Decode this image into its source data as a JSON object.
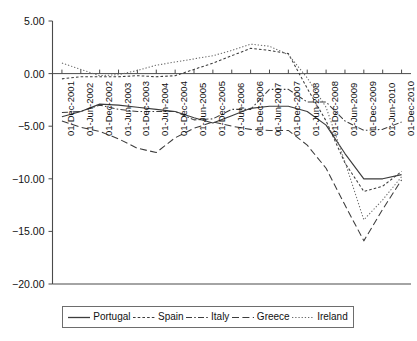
{
  "chart_data": {
    "type": "line",
    "title": "",
    "xlabel": "",
    "ylabel": "",
    "ylim": [
      -20.0,
      5.0
    ],
    "grid": false,
    "legend_position": "bottom",
    "y_ticks": [
      "5.00",
      "0.00",
      "-5.00",
      "-10.00",
      "-15.00",
      "-20.00"
    ],
    "y_tick_values": [
      5.0,
      0.0,
      -5.0,
      -10.0,
      -15.0,
      -20.0
    ],
    "categories": [
      "01-Dec-2001",
      "01-Jun-2002",
      "01-Dec-2002",
      "01-Jun-2003",
      "01-Dec-2003",
      "01-Jun-2004",
      "01-Dec-2004",
      "01-Jun-2005",
      "01-Dec-2005",
      "01-Jun-2006",
      "01-Dec-2006",
      "01-Jun-2007",
      "01-Dec-2007",
      "01-Jun-2008",
      "01-Dec-2008",
      "01-Jun-2009",
      "01-Dec-2009",
      "01-Jun-2010",
      "01-Dec-2010"
    ],
    "series": [
      {
        "name": "Portugal",
        "style": "solid",
        "color": "#3c3c3c",
        "values": [
          -4.1,
          -3.6,
          -2.9,
          -3.0,
          -3.2,
          -3.4,
          -3.6,
          -4.2,
          -4.7,
          -4.0,
          -3.3,
          -3.1,
          -3.1,
          -3.6,
          -4.9,
          -7.6,
          -10.0,
          -10.0,
          -9.6
        ]
      },
      {
        "name": "Spain",
        "style": "dotted",
        "color": "#3c3c3c",
        "values": [
          -0.5,
          -0.3,
          -0.3,
          -0.3,
          -0.2,
          -0.3,
          -0.2,
          0.4,
          1.0,
          1.7,
          2.4,
          2.2,
          1.9,
          -1.4,
          -4.5,
          -8.5,
          -11.2,
          -10.7,
          -9.3
        ]
      },
      {
        "name": "Italy",
        "style": "dashdot",
        "color": "#3c3c3c",
        "values": [
          -3.7,
          -3.6,
          -3.0,
          -3.4,
          -3.6,
          -3.6,
          -3.6,
          -4.4,
          -4.3,
          -3.4,
          -3.4,
          -1.5,
          -1.5,
          -2.7,
          -2.7,
          -4.5,
          -5.4,
          -5.3,
          -4.6
        ]
      },
      {
        "name": "Greece",
        "style": "dashed",
        "color": "#3c3c3c",
        "values": [
          -4.5,
          -5.1,
          -5.5,
          -6.2,
          -7.1,
          -7.5,
          -6.1,
          -5.2,
          -4.6,
          -5.0,
          -5.3,
          -5.4,
          -5.4,
          -6.8,
          -9.0,
          -12.5,
          -15.9,
          -12.9,
          -10.1
        ]
      },
      {
        "name": "Ireland",
        "style": "finedot",
        "color": "#6a6a6a",
        "values": [
          1.0,
          0.4,
          -0.2,
          -0.1,
          0.3,
          0.8,
          1.1,
          1.4,
          1.7,
          2.2,
          2.8,
          2.6,
          1.8,
          -0.4,
          -3.2,
          -8.4,
          -13.9,
          -12.0,
          -9.8
        ]
      }
    ]
  },
  "legend": {
    "items": [
      {
        "label": "Portugal",
        "style": "solid"
      },
      {
        "label": "Spain",
        "style": "dotted"
      },
      {
        "label": "Italy",
        "style": "dashdot"
      },
      {
        "label": "Greece",
        "style": "dashed"
      },
      {
        "label": "Ireland",
        "style": "finedot"
      }
    ]
  },
  "colors": {
    "axis": "#4a4a4a",
    "line": "#3c3c3c",
    "ireland": "#6a6a6a",
    "background": "#ffffff"
  }
}
